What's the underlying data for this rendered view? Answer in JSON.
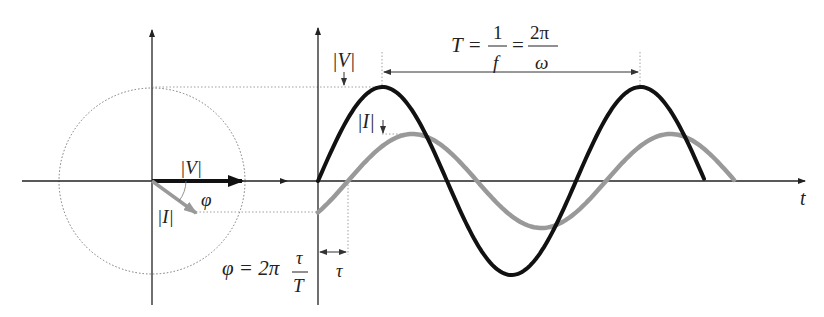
{
  "diagram": {
    "phasor": {
      "voltage_label": "|V|",
      "current_label": "|I|",
      "angle_label": "φ",
      "voltage_color": "#111111",
      "current_color": "#999999"
    },
    "waveform": {
      "axis_label": "t",
      "voltage_peak_label": "|V|",
      "current_peak_label": "|I|",
      "period_formula": {
        "lhs": "T =",
        "frac1_num": "1",
        "frac1_den": "f",
        "eq": "=",
        "frac2_num": "2π",
        "frac2_den": "ω"
      },
      "phase_formula": {
        "lhs": "φ = 2π",
        "num": "τ",
        "den": "T"
      },
      "tau_label": "τ",
      "voltage_amplitude": 94,
      "current_amplitude": 47,
      "period_px": 258,
      "shift_px": 30
    }
  }
}
